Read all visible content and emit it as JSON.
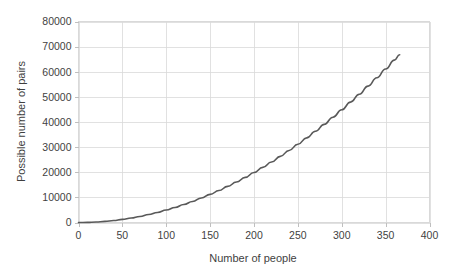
{
  "chart_data": {
    "type": "line",
    "title": "",
    "subtitle": "",
    "xlabel": "Number of people",
    "ylabel": "Possible number of pairs",
    "xlim": [
      0,
      400
    ],
    "ylim": [
      0,
      80000
    ],
    "grid": true,
    "legend": false,
    "legend_position": "none",
    "x_ticks": [
      0,
      50,
      100,
      150,
      200,
      250,
      300,
      350,
      400
    ],
    "x_tick_labels": [
      "0",
      "50",
      "100",
      "150",
      "200",
      "250",
      "300",
      "350",
      "400"
    ],
    "y_ticks": [
      0,
      10000,
      20000,
      30000,
      40000,
      50000,
      60000,
      70000,
      80000
    ],
    "y_tick_labels": [
      "0",
      "10000",
      "20000",
      "30000",
      "40000",
      "50000",
      "60000",
      "70000",
      "80000"
    ],
    "series": [
      {
        "name": "Possible number of pairs",
        "color": "#595959",
        "formula": "n(n-1)/2",
        "x": [
          0,
          10,
          20,
          30,
          40,
          50,
          60,
          70,
          80,
          90,
          100,
          110,
          120,
          130,
          140,
          150,
          160,
          170,
          180,
          190,
          200,
          210,
          220,
          230,
          240,
          250,
          260,
          270,
          280,
          290,
          300,
          310,
          320,
          330,
          340,
          350,
          360,
          366
        ],
        "values": [
          0,
          45,
          190,
          435,
          780,
          1225,
          1770,
          2415,
          3160,
          4005,
          4950,
          5995,
          7140,
          8385,
          9730,
          11175,
          12720,
          14365,
          16110,
          17955,
          19900,
          21945,
          24090,
          26335,
          28680,
          31125,
          33670,
          36315,
          39060,
          41905,
          44850,
          47895,
          51040,
          54285,
          57630,
          61075,
          64620,
          66795
        ]
      }
    ]
  },
  "colors": {
    "series_line": "#595959",
    "grid": "#d9d9d9",
    "border": "#d9d9d9",
    "text": "#3f3f3f",
    "background": "#ffffff"
  }
}
